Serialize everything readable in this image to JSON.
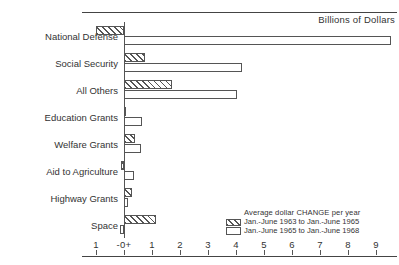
{
  "chart_data": {
    "type": "bar",
    "orientation": "horizontal",
    "title": "",
    "unit_caption": "Billions of Dollars",
    "xlabel": "",
    "ylabel": "",
    "xlim": [
      -1.35,
      9.9
    ],
    "grid": false,
    "zero_tick_label": "-0+",
    "xticks": [
      -1,
      0,
      1,
      2,
      3,
      4,
      5,
      6,
      7,
      8,
      9
    ],
    "xtick_labels": [
      "1",
      "-0+",
      "1",
      "2",
      "3",
      "4",
      "5",
      "6",
      "7",
      "8",
      "9"
    ],
    "categories": [
      "National Defense",
      "Social Security",
      "All Others",
      "Education Grants",
      "Welfare Grants",
      "Aid to Agriculture",
      "Highway Grants",
      "Space"
    ],
    "legend_title": "Average dollar CHANGE per year",
    "legend_position": "lower-right",
    "series": [
      {
        "name": "Jan.-June 1963 to Jan.-June 1965",
        "fill": "hatched",
        "values": [
          -1.0,
          0.75,
          1.7,
          0.05,
          0.4,
          -0.1,
          0.3,
          1.15
        ]
      },
      {
        "name": "Jan.-June 1965 to Jan.-June 1968",
        "fill": "open",
        "values": [
          9.55,
          4.2,
          4.05,
          0.65,
          0.6,
          0.35,
          0.15,
          -0.15
        ]
      }
    ]
  }
}
